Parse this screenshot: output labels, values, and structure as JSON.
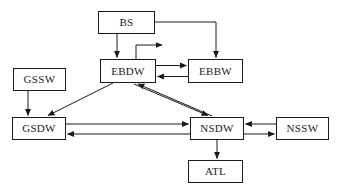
{
  "diagram": {
    "background_color": "#ffffff",
    "line_color": "#1a1a1a",
    "text_color": "#1a1a1a",
    "nodes": [
      {
        "id": "bs",
        "label": "BS",
        "x": 98,
        "y": 11,
        "w": 57,
        "h": 23
      },
      {
        "id": "gssw",
        "label": "GSSW",
        "x": 13,
        "y": 68,
        "w": 53,
        "h": 23
      },
      {
        "id": "ebdw",
        "label": "EBDW",
        "x": 100,
        "y": 59,
        "w": 56,
        "h": 24
      },
      {
        "id": "ebbw",
        "label": "EBBW",
        "x": 188,
        "y": 59,
        "w": 55,
        "h": 24
      },
      {
        "id": "gsdw",
        "label": "GSDW",
        "x": 12,
        "y": 117,
        "w": 54,
        "h": 23
      },
      {
        "id": "nsdw",
        "label": "NSDW",
        "x": 190,
        "y": 117,
        "w": 54,
        "h": 23
      },
      {
        "id": "nssw",
        "label": "NSSW",
        "x": 276,
        "y": 117,
        "w": 53,
        "h": 23
      },
      {
        "id": "atl",
        "label": "ATL",
        "x": 188,
        "y": 160,
        "w": 55,
        "h": 23
      }
    ],
    "edges": [
      {
        "id": "bs-ebdw",
        "from": "bs",
        "to": "ebdw",
        "kind": "vertical-down"
      },
      {
        "id": "bs-ebbw",
        "from": "bs",
        "to": "ebbw",
        "kind": "right-then-down"
      },
      {
        "id": "ebdw-self",
        "from": "ebdw",
        "to": "ebdw",
        "kind": "stub-up-right"
      },
      {
        "id": "ebdw-ebbw",
        "from": "ebdw",
        "to": "ebbw",
        "kind": "horizontal-right"
      },
      {
        "id": "ebbw-ebdw",
        "from": "ebbw",
        "to": "ebdw",
        "kind": "horizontal-left"
      },
      {
        "id": "gssw-gsdw",
        "from": "gssw",
        "to": "gsdw",
        "kind": "vertical-down"
      },
      {
        "id": "ebdw-gsdw",
        "from": "ebdw",
        "to": "gsdw",
        "kind": "diagonal-down-left"
      },
      {
        "id": "ebdw-nsdw",
        "from": "ebdw",
        "to": "nsdw",
        "kind": "diagonal-down-right"
      },
      {
        "id": "nsdw-ebdw",
        "from": "nsdw",
        "to": "ebdw",
        "kind": "diagonal-up-left"
      },
      {
        "id": "gsdw-nsdw",
        "from": "gsdw",
        "to": "nsdw",
        "kind": "horizontal-right"
      },
      {
        "id": "nsdw-gsdw",
        "from": "nsdw",
        "to": "gsdw",
        "kind": "horizontal-left"
      },
      {
        "id": "nssw-nsdw",
        "from": "nssw",
        "to": "nsdw",
        "kind": "horizontal-left"
      },
      {
        "id": "nsdw-nssw",
        "from": "nsdw",
        "to": "nssw",
        "kind": "horizontal-right"
      },
      {
        "id": "nsdw-atl",
        "from": "nsdw",
        "to": "atl",
        "kind": "vertical-down"
      }
    ]
  }
}
